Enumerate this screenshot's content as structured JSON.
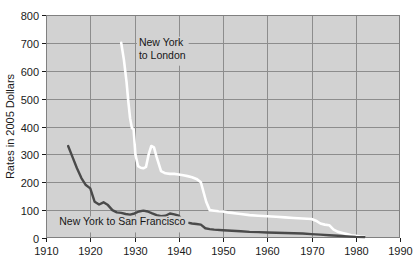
{
  "chart_data": {
    "type": "line",
    "title": "",
    "xlabel": "",
    "ylabel": "Rates in 2005 Dollars",
    "xlim": [
      1910,
      1990
    ],
    "ylim": [
      0,
      800
    ],
    "xticks": [
      1910,
      1920,
      1930,
      1940,
      1950,
      1960,
      1970,
      1980,
      1990
    ],
    "yticks": [
      0,
      100,
      200,
      300,
      400,
      500,
      600,
      700,
      800
    ],
    "grid": "horizontal-and-vertical-at-decades",
    "plot_background": "#d2d2d2",
    "legend_position": "inline-annotations",
    "annotations": [
      {
        "text_line1": "New York",
        "text_line2": "to London",
        "series": "New York to London",
        "x": 1931,
        "y": 690
      },
      {
        "text_line1": "New York to San Francisco",
        "text_line2": "",
        "series": "New York to San Francisco",
        "x": 1913,
        "y": 45
      }
    ],
    "series": [
      {
        "name": "New York to London",
        "color": "#ffffff",
        "x": [
          1927,
          1927.6,
          1928.2,
          1928.6,
          1929.0,
          1929.4,
          1929.8,
          1930.2,
          1930.8,
          1931.4,
          1932.0,
          1932.6,
          1933.2,
          1933.8,
          1934.4,
          1935.0,
          1936.0,
          1937.0,
          1938.0,
          1939.0,
          1940.0,
          1941.0,
          1942.0,
          1943.0,
          1944.0,
          1945.0,
          1945.6,
          1946.2,
          1947.0,
          1948.0,
          1949.0,
          1950.0,
          1951.0,
          1952.0,
          1953.0,
          1954.0,
          1956.0,
          1958.0,
          1960.0,
          1962.0,
          1964.0,
          1966.0,
          1968.0,
          1970.0,
          1971.0,
          1972.0,
          1973.0,
          1974.0,
          1975.0,
          1976.0,
          1977.0,
          1978.0,
          1979.0,
          1980.0,
          1981.0,
          1982.0
        ],
        "values": [
          700,
          640,
          560,
          490,
          430,
          395,
          390,
          300,
          258,
          252,
          250,
          255,
          300,
          330,
          325,
          290,
          240,
          232,
          230,
          230,
          228,
          225,
          222,
          218,
          212,
          200,
          165,
          130,
          100,
          98,
          96,
          95,
          92,
          90,
          88,
          86,
          82,
          80,
          78,
          76,
          74,
          72,
          70,
          68,
          62,
          52,
          48,
          46,
          30,
          22,
          18,
          14,
          10,
          8,
          5,
          4
        ]
      },
      {
        "name": "New York to San Francisco",
        "color": "#4a4a4a",
        "x": [
          1915,
          1916,
          1917,
          1918,
          1919,
          1920,
          1921,
          1922,
          1923,
          1924,
          1925,
          1926,
          1927,
          1928,
          1929,
          1930,
          1931,
          1932,
          1933,
          1934,
          1935,
          1936,
          1937,
          1938,
          1939,
          1940,
          1941,
          1942,
          1943,
          1944,
          1945,
          1946,
          1947,
          1948,
          1950,
          1952,
          1954,
          1956,
          1958,
          1960,
          1962,
          1964,
          1966,
          1968,
          1970,
          1972,
          1974,
          1976,
          1978,
          1980,
          1982
        ],
        "values": [
          330,
          290,
          250,
          215,
          190,
          178,
          130,
          120,
          128,
          118,
          100,
          92,
          90,
          86,
          84,
          88,
          95,
          98,
          95,
          88,
          82,
          78,
          80,
          88,
          85,
          80,
          60,
          55,
          52,
          50,
          48,
          35,
          32,
          30,
          28,
          26,
          24,
          22,
          21,
          20,
          19,
          18,
          17,
          16,
          14,
          12,
          10,
          8,
          6,
          4,
          3
        ]
      }
    ]
  }
}
